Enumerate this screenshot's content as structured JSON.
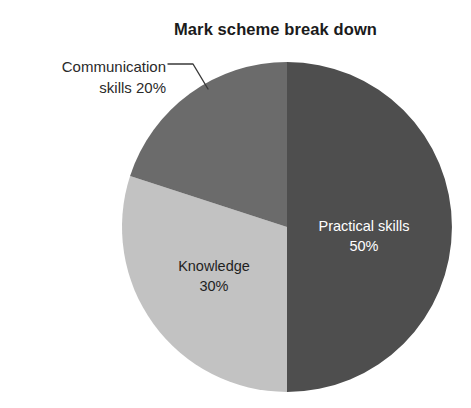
{
  "chart": {
    "title": "Mark scheme break down"
  },
  "chart_data": {
    "type": "pie",
    "title": "Mark scheme break down",
    "subtitle": "",
    "xlabel": "",
    "ylabel": "",
    "legend_position": "none",
    "grid": false,
    "labels_inside": true,
    "units": "percent",
    "total": 100,
    "categories": [
      "Practical skills",
      "Knowledge",
      "Communication skills"
    ],
    "values": [
      50,
      30,
      20
    ],
    "slices": [
      {
        "name": "Practical skills",
        "value": 50,
        "value_label": "50%",
        "label_line1": "Practical skills",
        "label_line2": "50%",
        "color": "#4e4e4e",
        "text_color": "#ffffff",
        "label_placement": "inside",
        "start_angle_deg": 0,
        "end_angle_deg": 180
      },
      {
        "name": "Knowledge",
        "value": 30,
        "value_label": "30%",
        "label_line1": "Knowledge",
        "label_line2": "30%",
        "color": "#c2c2c2",
        "text_color": "#1f1f1f",
        "label_placement": "inside",
        "start_angle_deg": 180,
        "end_angle_deg": 288
      },
      {
        "name": "Communication skills",
        "value": 20,
        "value_label": "20%",
        "label_line1": "Communication",
        "label_line2": "skills 20%",
        "color": "#6b6b6b",
        "text_color": "#2a2a2a",
        "label_placement": "outside-leader-line",
        "start_angle_deg": 288,
        "end_angle_deg": 360
      }
    ]
  },
  "geometry": {
    "center_x": 287,
    "center_y": 227,
    "radius": 165
  },
  "colors": {
    "background": "#ffffff",
    "title_text": "#1b1b1b",
    "leader_line": "#3a3a3a",
    "slice_practical": "#4e4e4e",
    "slice_knowledge": "#c2c2c2",
    "slice_communication": "#6b6b6b"
  }
}
